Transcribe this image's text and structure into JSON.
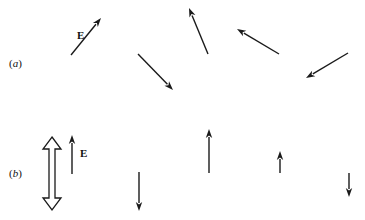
{
  "diagram": {
    "panels": [
      {
        "id": "a",
        "label": "(a)",
        "label_pos": [
          9,
          58
        ],
        "field_label": "E",
        "field_label_pos": [
          77,
          30
        ],
        "arrows": [
          {
            "from": [
              71,
              55
            ],
            "to": [
              101,
              18
            ]
          },
          {
            "from": [
              138,
              54
            ],
            "to": [
              173,
              90
            ]
          },
          {
            "from": [
              208,
              54
            ],
            "to": [
              189,
              8
            ]
          },
          {
            "from": [
              279,
              54
            ],
            "to": [
              237,
              29
            ]
          },
          {
            "from": [
              348,
              53
            ],
            "to": [
              306,
              78
            ]
          }
        ]
      },
      {
        "id": "b",
        "label": "(b)",
        "label_pos": [
          9,
          168
        ],
        "field_label": "E",
        "field_label_pos": [
          80,
          148
        ],
        "polarization_axis": {
          "x": 52,
          "y_top": 137,
          "y_bottom": 210
        },
        "arrows": [
          {
            "from": [
              72,
              174
            ],
            "to": [
              72,
              135
            ]
          },
          {
            "from": [
              139,
              172
            ],
            "to": [
              139,
              211
            ]
          },
          {
            "from": [
              209,
              173
            ],
            "to": [
              209,
              129
            ]
          },
          {
            "from": [
              280,
              173
            ],
            "to": [
              280,
              151
            ]
          },
          {
            "from": [
              349,
              173
            ],
            "to": [
              349,
              197
            ]
          }
        ]
      }
    ],
    "colors": {
      "arrow": "#1a1a1a",
      "background": "#ffffff"
    }
  }
}
